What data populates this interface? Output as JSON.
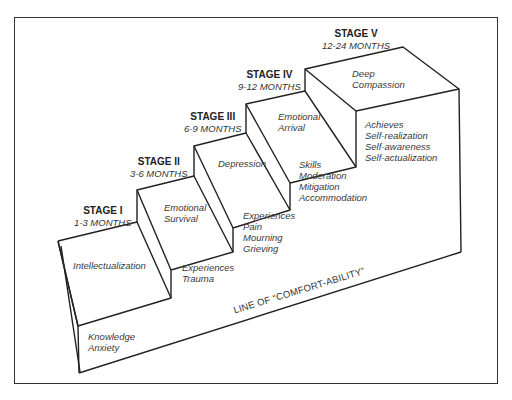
{
  "diagram": {
    "type": "staircase",
    "stages": [
      {
        "title": "STAGE I",
        "duration": "1-3 MONTHS",
        "top_label": [
          "Intellectualization"
        ],
        "riser_label": [
          "Knowledge",
          "Anxiety"
        ]
      },
      {
        "title": "STAGE II",
        "duration": "3-6 MONTHS",
        "top_label": [
          "Emotional",
          "Survival"
        ],
        "riser_label": [
          "Experiences",
          "Trauma"
        ]
      },
      {
        "title": "STAGE III",
        "duration": "6-9 MONTHS",
        "top_label": [
          "Depression"
        ],
        "riser_label": [
          "Experiences",
          "Pain",
          "Mourning",
          "Grieving"
        ]
      },
      {
        "title": "STAGE IV",
        "duration": "9-12 MONTHS",
        "top_label": [
          "Emotional",
          "Arrival"
        ],
        "riser_label": [
          "Skills",
          "Moderation",
          "Mitigation",
          "Accommodation"
        ]
      },
      {
        "title": "STAGE V",
        "duration": "12-24 MONTHS",
        "top_label": [
          "Deep",
          "Compassion"
        ],
        "riser_label": [
          "Achieves",
          "Self-realization",
          "Self-awareness",
          "Self-actualization"
        ]
      }
    ],
    "baseline_label": "LINE OF “COMFORT-ABILITY”",
    "colors": {
      "line": "#222222",
      "text": "#333333",
      "background": "#ffffff"
    }
  }
}
